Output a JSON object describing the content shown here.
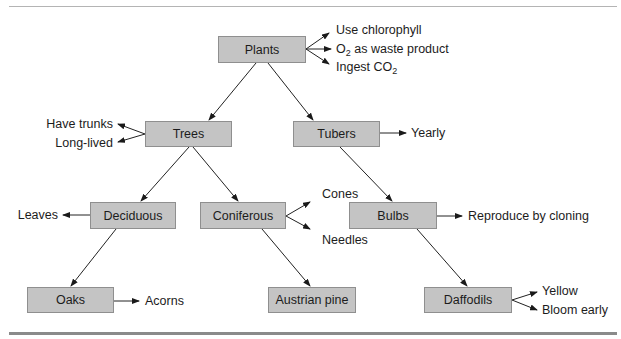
{
  "diagram": {
    "type": "semantic-network-hierarchy",
    "colors": {
      "node_fill": "#c4c4c4",
      "node_border": "#8f8f8f",
      "line": "#222222",
      "rule": "#8a8a8a"
    },
    "nodes": {
      "plants": {
        "label": "Plants",
        "attributes": [
          "Use chlorophyll",
          "O2 as waste product",
          "Ingest CO2"
        ]
      },
      "trees": {
        "label": "Trees",
        "attributes": [
          "Have trunks",
          "Long-lived"
        ]
      },
      "tubers": {
        "label": "Tubers",
        "attributes": [
          "Yearly"
        ]
      },
      "deciduous": {
        "label": "Deciduous",
        "attributes": [
          "Leaves"
        ]
      },
      "coniferous": {
        "label": "Coniferous",
        "attributes": [
          "Cones",
          "Needles"
        ]
      },
      "bulbs": {
        "label": "Bulbs",
        "attributes": [
          "Reproduce by cloning"
        ]
      },
      "oaks": {
        "label": "Oaks",
        "attributes": [
          "Acorns"
        ]
      },
      "austrian_pine": {
        "label": "Austrian pine",
        "attributes": []
      },
      "daffodils": {
        "label": "Daffodils",
        "attributes": [
          "Yellow",
          "Bloom early"
        ]
      }
    },
    "attribute_text": {
      "o2_prefix": "O",
      "o2_sub": "2",
      "o2_suffix": " as waste product",
      "co2_prefix": "Ingest CO",
      "co2_sub": "2"
    },
    "edges": [
      [
        "Plants",
        "Trees"
      ],
      [
        "Plants",
        "Tubers"
      ],
      [
        "Trees",
        "Deciduous"
      ],
      [
        "Trees",
        "Coniferous"
      ],
      [
        "Tubers",
        "Bulbs"
      ],
      [
        "Deciduous",
        "Oaks"
      ],
      [
        "Coniferous",
        "Austrian pine"
      ],
      [
        "Bulbs",
        "Daffodils"
      ]
    ]
  }
}
